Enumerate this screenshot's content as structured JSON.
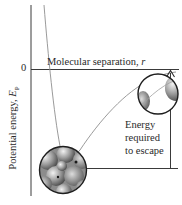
{
  "diagram": {
    "y_axis_label_prefix": "Potential energy, ",
    "y_axis_label_symbol": "E",
    "y_axis_label_subscript": "P",
    "zero_tick_label": "0",
    "x_axis_label_prefix": "Molecular separation, ",
    "x_axis_label_symbol": "r",
    "annotation_lines": [
      "Energy",
      "required",
      "to escape"
    ],
    "colors": {
      "line": "#2a2a2a",
      "curve": "#8a8a8a",
      "sphere_light": "#e8e8e8",
      "sphere_dark": "#5a5a5a",
      "background": "#ffffff"
    },
    "elements": {
      "near_molecules_inset": "magnified view of tightly packed molecules at potential-energy minimum",
      "far_molecules_inset": "magnified view of widely separated molecules near zero potential energy"
    }
  }
}
